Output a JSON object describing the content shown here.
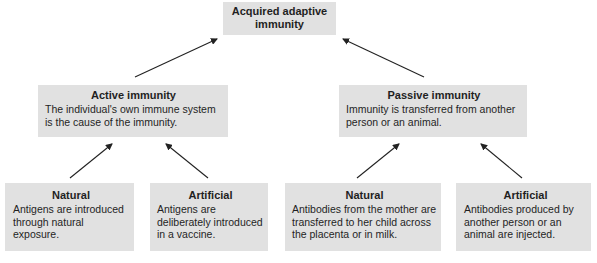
{
  "root": {
    "title": "Acquired adaptive immunity",
    "title_line1": "Acquired adaptive",
    "title_line2": "immunity"
  },
  "active": {
    "title": "Active immunity",
    "description": "The individual's own immune system is the cause of the immunity.",
    "children": [
      {
        "title": "Natural",
        "description": "Antigens are introduced through natural exposure."
      },
      {
        "title": "Artificial",
        "description": "Antigens are deliberately introduced in a vaccine."
      }
    ]
  },
  "passive": {
    "title": "Passive immunity",
    "description": "Immunity is transferred from another person or an animal.",
    "children": [
      {
        "title": "Natural",
        "description": "Antibodies from the mother are transferred to her child across the placenta or in milk."
      },
      {
        "title": "Artificial",
        "description": "Antibodies produced by another person or an animal are injected."
      }
    ]
  },
  "colors": {
    "box_fill": "#e1e1e1",
    "text": "#1f1f1f",
    "arrow": "#222222"
  }
}
